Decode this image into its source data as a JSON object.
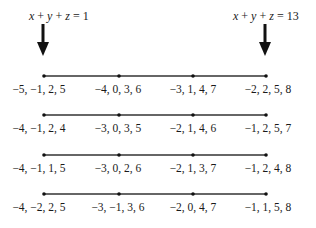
{
  "annotations": {
    "left": {
      "text": "x + y + z = 1",
      "sum": 1
    },
    "right": {
      "text": "x + y + z = 13",
      "sum": 13
    }
  },
  "rows": [
    {
      "points": [
        "−5, −1, 2, 5",
        "−4, 0, 3, 6",
        "−3, 1, 4, 7",
        "−2, 2, 5, 8"
      ]
    },
    {
      "points": [
        "−4, −1, 2, 4",
        "−3, 0, 3, 5",
        "−2, 1, 4, 6",
        "−1, 2, 5, 7"
      ]
    },
    {
      "points": [
        "−4, −1, 1, 5",
        "−3, 0, 2, 6",
        "−2, 1, 3, 7",
        "−1, 2, 4, 8"
      ]
    },
    {
      "points": [
        "−4, −2, 2, 5",
        "−3, −1, 3, 6",
        "−2, 0, 4, 7",
        "−1, 1, 5, 8"
      ]
    }
  ],
  "colors": {
    "ink": "#1a1a1a",
    "line": "#333333"
  }
}
